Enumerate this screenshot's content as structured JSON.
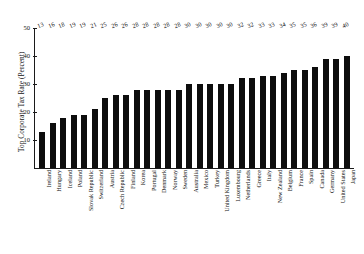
{
  "chart_data": {
    "type": "bar",
    "title": "",
    "subtitle": "",
    "xlabel": "",
    "ylabel": "Top Corporate Tax Rate (Percent)",
    "ylim": [
      0,
      50
    ],
    "yticks": [
      10,
      20,
      30,
      40,
      50
    ],
    "grid": false,
    "legend": null,
    "orientation": "vertical",
    "bar_color": "#0d0d0d",
    "value_labels_shown": true,
    "categories": [
      "Ireland",
      "Hungary",
      "Iceland",
      "Poland",
      "Slovak Republic",
      "Switzerland",
      "Austria",
      "Czech Republic",
      "Finland",
      "Korea",
      "Portugal",
      "Denmark",
      "Norway",
      "Sweden",
      "Australia",
      "Mexico",
      "Turkey",
      "United Kingdom",
      "Luxembourg",
      "Netherlands",
      "Greece",
      "Italy",
      "New Zealand",
      "Belgium",
      "France",
      "Spain",
      "Canada",
      "Germany",
      "United States",
      "Japan"
    ],
    "values": [
      13,
      16,
      18,
      19,
      19,
      21,
      25,
      26,
      26,
      28,
      28,
      28,
      28,
      28,
      30,
      30,
      30,
      30,
      30,
      32,
      32,
      33,
      33,
      34,
      35,
      35,
      36,
      39,
      39,
      40
    ]
  }
}
